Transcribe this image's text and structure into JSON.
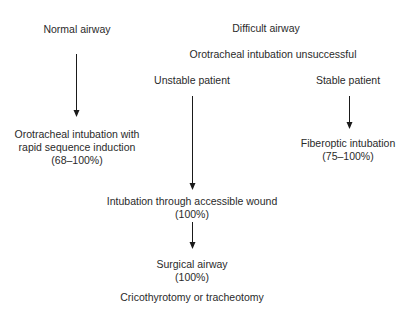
{
  "diagram": {
    "normal": {
      "title": "Normal airway",
      "result_line1": "Orotracheal intubation with",
      "result_line2": "rapid sequence induction",
      "result_rate": "(68–100%)"
    },
    "difficult": {
      "title": "Difficult airway",
      "condition": "Orotracheal intubation unsuccessful",
      "unstable": {
        "title": "Unstable patient",
        "step1_line1": "Intubation through accessible wound",
        "step1_rate": "(100%)",
        "step2_line1": "Surgical airway",
        "step2_rate": "(100%)",
        "step2_note": "Cricothyrotomy or tracheotomy"
      },
      "stable": {
        "title": "Stable patient",
        "result_line1": "Fiberoptic intubation",
        "result_rate": "(75–100%)"
      }
    },
    "colors": {
      "text": "#2a2a2a",
      "arrow": "#1a1a1a",
      "background": "#ffffff"
    }
  }
}
